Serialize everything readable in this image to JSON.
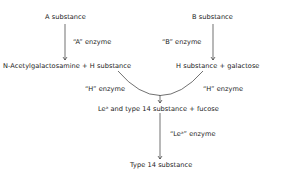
{
  "diagram": {
    "nodes": {
      "a_substance": "A substance",
      "b_substance": "B substance",
      "left_product": "N-Acetylgalactosamine + H substance",
      "right_product": "H substance + galactose",
      "lea_product": "Leᵃ and type 14 substance + fucose",
      "type14": "Type 14 substance"
    },
    "enzymes": {
      "a_enzyme": "“A” enzyme",
      "b_enzyme": "“B” enzyme",
      "h_enzyme_left": "“H” enzyme",
      "h_enzyme_right": "“H” enzyme",
      "lea_enzyme": "“Leᵃ” enzyme"
    },
    "colors": {
      "text": "#1a1a1a",
      "line": "#333333"
    }
  }
}
